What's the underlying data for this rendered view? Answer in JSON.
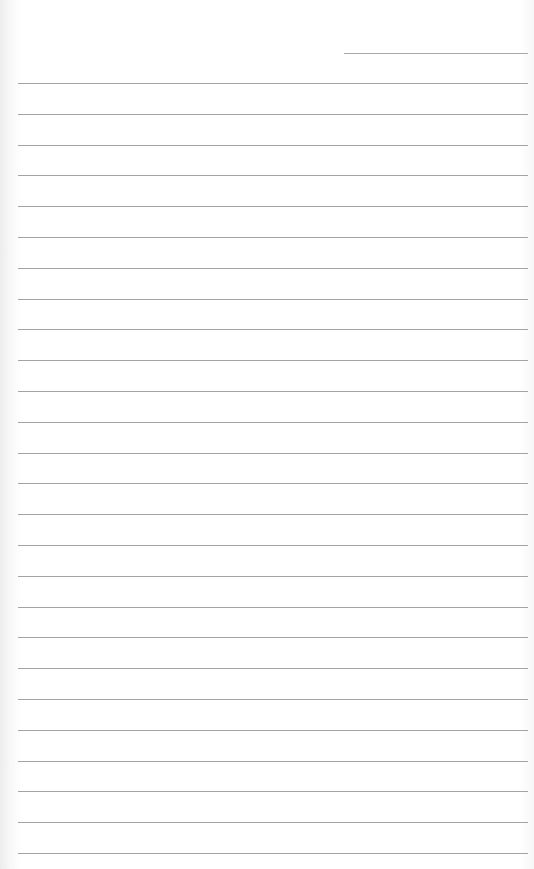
{
  "page": {
    "type": "lined-notepaper",
    "background_color": "#ffffff",
    "line_color": "#a4a4a4",
    "date_line": {
      "left": 344,
      "top": 53,
      "width": 184
    },
    "rules": {
      "count": 26,
      "first_top": 83,
      "spacing": 30.8,
      "left": 18,
      "width": 510
    }
  }
}
